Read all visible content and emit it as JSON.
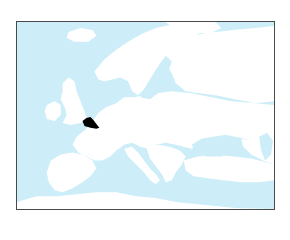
{
  "map": {
    "region": "Europe",
    "highlighted_country": "Belgium",
    "colors": {
      "sea": "#cdeef8",
      "land": "#ffffff",
      "highlight": "#000000",
      "border": "#4a4a4a"
    }
  }
}
